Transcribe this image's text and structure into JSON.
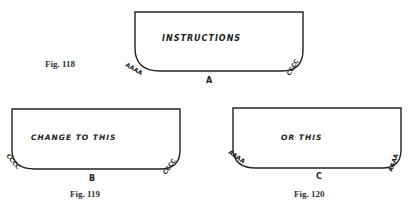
{
  "figures": [
    {
      "id": "fig118",
      "caption": "Fig. 118",
      "label": "A",
      "text": "INSTRUCTIONS",
      "left_marks": "AAAA",
      "right_marks": "CCCC"
    },
    {
      "id": "fig119",
      "caption": "Fig. 119",
      "label": "B",
      "text": "CHANGE TO THIS",
      "left_marks": "CCCC",
      "right_marks": "CCCC"
    },
    {
      "id": "fig120",
      "caption": "Fig. 120",
      "label": "C",
      "text": "OR THIS",
      "left_marks": "AAAA",
      "right_marks": "AAAA"
    }
  ]
}
